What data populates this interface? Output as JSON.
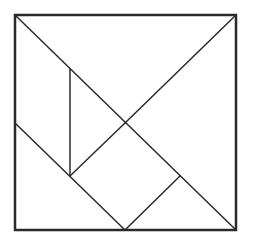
{
  "diagram": {
    "type": "tangram",
    "background": "#ffffff",
    "stroke_color": "#2a2a2a",
    "frame": {
      "x": 15,
      "y": 15,
      "width": 221,
      "height": 215,
      "stroke_width": 2.5
    },
    "lines": [
      {
        "name": "main-diagonal",
        "x1": 15,
        "y1": 15,
        "x2": 236,
        "y2": 230
      },
      {
        "name": "upper-right-diagonal",
        "x1": 236,
        "y1": 15,
        "x2": 125,
        "y2": 123
      },
      {
        "name": "center-to-lower-left",
        "x1": 125,
        "y1": 123,
        "x2": 70,
        "y2": 176
      },
      {
        "name": "vertical-divider",
        "x1": 70,
        "y1": 69,
        "x2": 70,
        "y2": 176
      },
      {
        "name": "left-mid-to-bottom-mid",
        "x1": 15,
        "y1": 123,
        "x2": 125,
        "y2": 230
      },
      {
        "name": "bottom-mid-to-right",
        "x1": 125,
        "y1": 230,
        "x2": 180,
        "y2": 176
      }
    ],
    "line_stroke_width": 1.5
  }
}
